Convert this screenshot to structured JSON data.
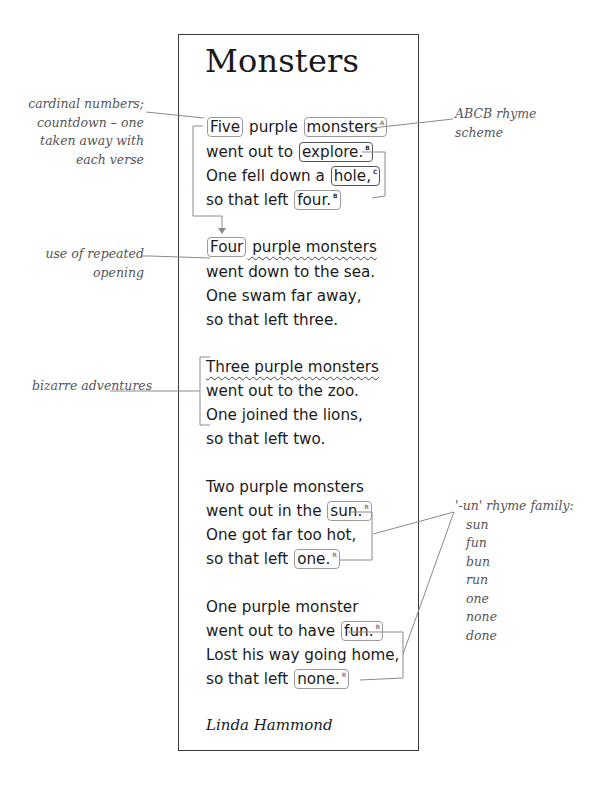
{
  "poem": {
    "title": "Monsters",
    "author": "Linda Hammond",
    "verses": [
      {
        "lines": [
          {
            "pre": "",
            "box1": "Five",
            "mid": " purple ",
            "box2": "monsters",
            "tag2": "A"
          },
          {
            "pre": "went out to ",
            "box": "explore.",
            "tag": "B"
          },
          {
            "pre": "One fell down a ",
            "box": "hole,",
            "tag": "C"
          },
          {
            "pre": "so that left ",
            "box": "four.",
            "tag": "B"
          }
        ]
      },
      {
        "lines": [
          {
            "box": "Four",
            "post": " purple monsters"
          },
          {
            "text": "went down to the sea."
          },
          {
            "text": "One swam far away,"
          },
          {
            "text": "so that left three."
          }
        ]
      },
      {
        "lines": [
          {
            "text": "Three purple monsters"
          },
          {
            "text": "went out to the zoo."
          },
          {
            "text": "One joined the lions,"
          },
          {
            "text": "so that left two."
          }
        ]
      },
      {
        "lines": [
          {
            "text": "Two purple monsters"
          },
          {
            "pre": "went out in the ",
            "box": "sun.",
            "tag": "R"
          },
          {
            "text": "One got far too hot,"
          },
          {
            "pre": "so that left ",
            "box": "one.",
            "tag": "R"
          }
        ]
      },
      {
        "lines": [
          {
            "text": "One purple monster"
          },
          {
            "pre": "went out to have ",
            "box": "fun.",
            "tag": "R"
          },
          {
            "text": "Lost his way going home,"
          },
          {
            "pre": "so that left ",
            "box": "none.",
            "tag": "R"
          }
        ]
      }
    ]
  },
  "annotations": {
    "cardinal": [
      "cardinal numbers;",
      "countdown – one",
      "taken away with",
      "each verse"
    ],
    "rhyme_scheme": [
      "ABCB rhyme",
      "scheme"
    ],
    "repeated_opening": [
      "use of repeated",
      "opening"
    ],
    "bizarre": [
      "bizarre adventures"
    ],
    "un_family": {
      "heading": "'-un' rhyme family:",
      "words": [
        "sun",
        "fun",
        "bun",
        "run",
        "one",
        "none",
        "done"
      ]
    }
  },
  "colors": {
    "text": "#1a1a1a",
    "annotation_text": "#555555",
    "frame": "#3a3a3a",
    "connector": "#8a8a8a"
  }
}
